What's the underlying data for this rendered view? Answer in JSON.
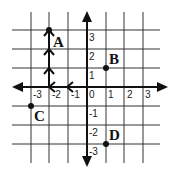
{
  "diagram": {
    "type": "coordinate-grid",
    "x_range": [
      -3,
      3
    ],
    "y_range": [
      -3,
      3
    ],
    "x_tick_labels": [
      "-3",
      "-2",
      "-1",
      "0",
      "1",
      "2",
      "3"
    ],
    "y_tick_labels": [
      "3",
      "2",
      "1",
      "-1",
      "-2",
      "-3"
    ],
    "points": [
      {
        "label": "A",
        "x": -2,
        "y": 3
      },
      {
        "label": "B",
        "x": 1,
        "y": 1
      },
      {
        "label": "C",
        "x": -3,
        "y": -1
      },
      {
        "label": "D",
        "x": 1,
        "y": -3
      }
    ],
    "path": {
      "description": "From origin move 2 left, then 3 up to A",
      "steps": [
        {
          "direction": "left",
          "from": [
            0,
            0
          ],
          "to": [
            -1,
            0
          ]
        },
        {
          "direction": "left",
          "from": [
            -1,
            0
          ],
          "to": [
            -2,
            0
          ]
        },
        {
          "direction": "up",
          "from": [
            -2,
            0
          ],
          "to": [
            -2,
            1
          ]
        },
        {
          "direction": "up",
          "from": [
            -2,
            1
          ],
          "to": [
            -2,
            2
          ]
        },
        {
          "direction": "up",
          "from": [
            -2,
            2
          ],
          "to": [
            -2,
            3
          ]
        }
      ]
    },
    "colors": {
      "line": "#111111",
      "grid": "#333333",
      "background": "#ffffff"
    }
  }
}
